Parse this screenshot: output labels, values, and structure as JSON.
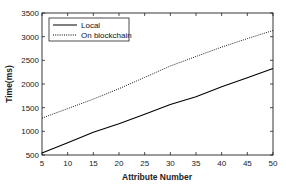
{
  "chart_data": {
    "type": "line",
    "title": "",
    "xlabel": "Attribute Number",
    "ylabel": "Time(ms)",
    "xlim": [
      5,
      50
    ],
    "ylim": [
      500,
      3500
    ],
    "xticks": [
      5,
      10,
      15,
      20,
      25,
      30,
      35,
      40,
      45,
      50
    ],
    "yticks": [
      500,
      1000,
      1500,
      2000,
      2500,
      3000,
      3500
    ],
    "grid": false,
    "legend_position": "upper left",
    "x": [
      5,
      10,
      15,
      20,
      25,
      30,
      35,
      40,
      45,
      50
    ],
    "series": [
      {
        "name": "Local",
        "style": "solid",
        "color": "#000000",
        "values": [
          540,
          760,
          980,
          1160,
          1360,
          1570,
          1730,
          1940,
          2130,
          2330
        ]
      },
      {
        "name": "On blockchain",
        "style": "dotted",
        "color": "#000000",
        "values": [
          1280,
          1480,
          1680,
          1900,
          2140,
          2380,
          2580,
          2780,
          2960,
          3130
        ]
      }
    ]
  }
}
